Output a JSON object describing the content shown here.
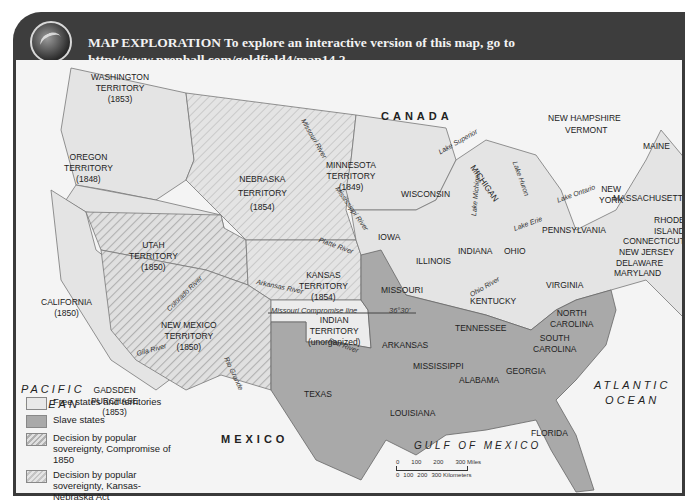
{
  "header": {
    "icon": "globe-icon",
    "line1": "MAP EXPLORATION  To explore an interactive version of this map, go to",
    "line2": "http://www.prenhall.com/goldfield4/map14.2"
  },
  "colors": {
    "header_bg": "#3d3d3d",
    "free": "#e6e6e6",
    "slave": "#a8a8a8",
    "compromise_1850": "#c8c8c8",
    "kansas_nebraska": "#d8d8d8",
    "water": "#f4f4f4",
    "border": "#3a3a3a"
  },
  "countries": {
    "canada": "CANADA",
    "mexico": "MEXICO"
  },
  "oceans": {
    "pacific": [
      "PACIFIC",
      "OCEAN"
    ],
    "atlantic": [
      "ATLANTIC",
      "OCEAN"
    ],
    "gulf": "GULF OF MEXICO"
  },
  "territories": {
    "washington": [
      "WASHINGTON",
      "TERRITORY",
      "(1853)"
    ],
    "oregon": [
      "OREGON",
      "TERRITORY",
      "(1848)"
    ],
    "nebraska": [
      "NEBRASKA",
      "TERRITORY",
      "(1854)"
    ],
    "minnesota": [
      "MINNESOTA",
      "TERRITORY",
      "(1849)"
    ],
    "utah": [
      "UTAH",
      "TERRITORY",
      "(1850)"
    ],
    "california": [
      "CALIFORNIA",
      "(1850)"
    ],
    "kansas": [
      "KANSAS",
      "TERRITORY",
      "(1854)"
    ],
    "new_mexico": [
      "NEW MEXICO",
      "TERRITORY",
      "(1850)"
    ],
    "indian": [
      "INDIAN",
      "TERRITORY",
      "(unorganized)"
    ],
    "gadsden": [
      "GADSDEN",
      "PURCHASE",
      "(1853)"
    ]
  },
  "states": {
    "wisconsin": "WISCONSIN",
    "michigan": "MICHIGAN",
    "iowa": "IOWA",
    "illinois": "ILLINOIS",
    "indiana": "INDIANA",
    "ohio": "OHIO",
    "pennsylvania": "PENNSYLVANIA",
    "new_york": [
      "NEW",
      "YORK"
    ],
    "new_hampshire": "NEW HAMPSHIRE",
    "vermont": "VERMONT",
    "maine": "MAINE",
    "massachusetts": "MASSACHUSETTS",
    "rhode_island": [
      "RHODE",
      "ISLAND"
    ],
    "connecticut": "CONNECTICUT",
    "new_jersey": "NEW JERSEY",
    "delaware": "DELAWARE",
    "maryland": "MARYLAND",
    "missouri": "MISSOURI",
    "kentucky": "KENTUCKY",
    "virginia": "VIRGINIA",
    "tennessee": "TENNESSEE",
    "north_carolina": [
      "NORTH",
      "CAROLINA"
    ],
    "south_carolina": [
      "SOUTH",
      "CAROLINA"
    ],
    "arkansas": "ARKANSAS",
    "mississippi": "MISSISSIPPI",
    "alabama": "ALABAMA",
    "georgia": "GEORGIA",
    "texas": "TEXAS",
    "louisiana": "LOUISIANA",
    "florida": "FLORIDA"
  },
  "features": {
    "missouri_river": "Missouri River",
    "mississippi_river": "Mississippi River",
    "platte_river": "Platte River",
    "arkansas_river": "Arkansas River",
    "colorado_river": "Colorado River",
    "gila_river": "Gila River",
    "rio_grande": "Rio Grande",
    "red_river": "Red River",
    "ohio_river": "Ohio River",
    "lake_superior": "Lake Superior",
    "lake_michigan": "Lake Michigan",
    "lake_huron": "Lake Huron",
    "lake_erie": "Lake Erie",
    "lake_ontario": "Lake Ontario",
    "compromise_line": "Missouri Compromise line",
    "compromise_lat": "36°30'"
  },
  "legend": [
    {
      "label": "Free states and territories",
      "swatch": "free"
    },
    {
      "label": "Slave states",
      "swatch": "slave"
    },
    {
      "label": "Decision by popular sovereignty, Compromise of 1850",
      "swatch": "compromise_1850"
    },
    {
      "label": "Decision by popular sovereignty, Kansas-Nebraska Act",
      "swatch": "kansas_nebraska"
    }
  ],
  "scale": {
    "miles": [
      "0",
      "100",
      "200",
      "300 Miles"
    ],
    "km": [
      "0",
      "100",
      "200",
      "300 Kilometers"
    ]
  }
}
